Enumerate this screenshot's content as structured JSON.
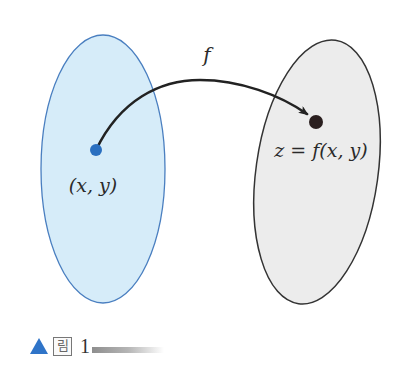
{
  "figure": {
    "domain_set": {
      "label": "(x, y)",
      "fill_color": "#d6ecf9",
      "stroke_color": "#4a7fc0",
      "point_color": "#2a6fc0"
    },
    "codomain_set": {
      "label": "z = f(x, y)",
      "fill_color": "#ececec",
      "stroke_color": "#333333",
      "point_color": "#2a1f1f"
    },
    "mapping": {
      "label": "f",
      "arrow_color": "#222222"
    }
  },
  "caption": {
    "marker_color": "#2f74c8",
    "figure_word": "림",
    "number": "1"
  }
}
